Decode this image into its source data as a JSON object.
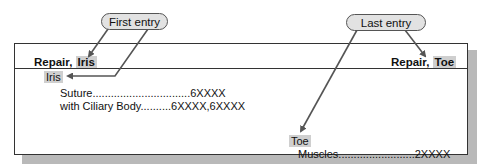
{
  "callouts": {
    "first": "First entry",
    "last": "Last entry"
  },
  "guide_words": {
    "left_term": "Repair, ",
    "left_highlight": "Iris",
    "right_term": "Repair, ",
    "right_highlight": "Toe"
  },
  "entries": {
    "iris": {
      "heading": "Iris",
      "items": [
        {
          "label": "Suture",
          "leader": "................................",
          "code": "6XXXX"
        },
        {
          "label": "with Ciliary Body",
          "leader": "..........",
          "code": "6XXXX,6XXXX"
        }
      ]
    },
    "toe": {
      "heading": "Toe",
      "items": [
        {
          "label": "Muscles",
          "leader": ".........................",
          "code": "2XXXX"
        }
      ]
    }
  },
  "colors": {
    "highlight": "#cfcfcf",
    "pill_fill": "#e2e2e2",
    "arrow": "#555555",
    "shadow": "#b9b9b9"
  }
}
